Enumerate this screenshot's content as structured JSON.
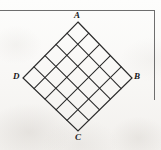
{
  "figure": {
    "shape": "square rotated 45 degrees (diamond)",
    "grid_divisions": 5,
    "background_color": "#f8f7f5",
    "line_color": "#2b2b2b",
    "border_color": "#6e6e6e",
    "vertices": [
      {
        "id": "A",
        "label": "A",
        "position": "top",
        "x": 78,
        "y": 22
      },
      {
        "id": "B",
        "label": "B",
        "position": "right",
        "x": 132,
        "y": 78
      },
      {
        "id": "C",
        "label": "C",
        "position": "bottom",
        "x": 78,
        "y": 131
      },
      {
        "id": "D",
        "label": "D",
        "position": "left",
        "x": 23,
        "y": 78
      }
    ],
    "border": {
      "top_rule_y": 10,
      "top_rule_width": 155,
      "right_rule_x": 154,
      "right_rule_height": 90
    }
  },
  "chart_data": {
    "type": "diagram",
    "shape": "square",
    "rotation_degrees": 45,
    "grid_divisions": 5,
    "cell_count": 25,
    "vertex_labels": [
      "A",
      "B",
      "C",
      "D"
    ],
    "vertex_points": [
      [
        78,
        22
      ],
      [
        132,
        78
      ],
      [
        78,
        131
      ],
      [
        23,
        78
      ]
    ],
    "xlabel": "",
    "ylabel": "",
    "grid": true,
    "legend": "none"
  }
}
